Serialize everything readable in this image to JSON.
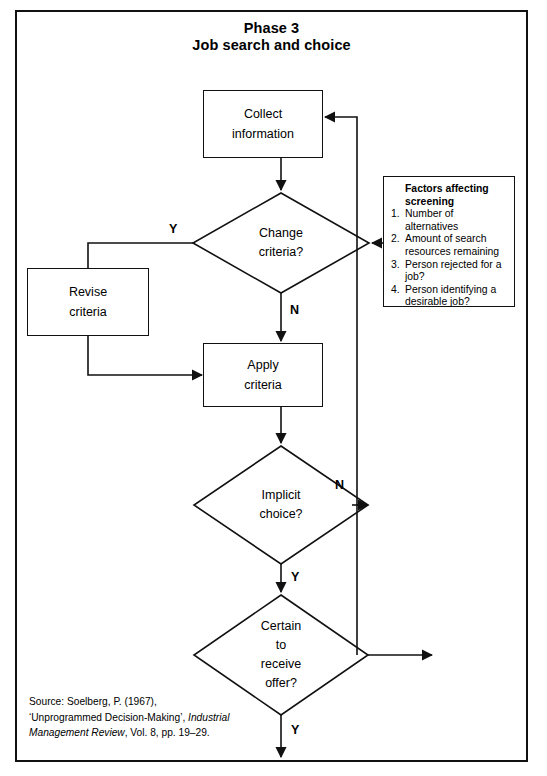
{
  "title": {
    "line1": "Phase 3",
    "line2": "Job search and choice"
  },
  "nodes": {
    "collect": {
      "line1": "Collect",
      "line2": "information"
    },
    "change_criteria": {
      "line1": "Change",
      "line2": "criteria?"
    },
    "revise": {
      "line1": "Revise",
      "line2": "criteria"
    },
    "apply": {
      "line1": "Apply",
      "line2": "criteria"
    },
    "implicit": {
      "line1": "Implicit",
      "line2": "choice?"
    },
    "certain": {
      "line1": "Certain",
      "line2": "to",
      "line3": "receive",
      "line4": "offer?"
    }
  },
  "edge_labels": {
    "change_yes": "Y",
    "change_no": "N",
    "implicit_no": "N",
    "implicit_yes": "Y",
    "certain_yes": "Y"
  },
  "factors": {
    "heading_line1": "Factors affecting",
    "heading_line2": "screening",
    "items": [
      {
        "num": "1.",
        "text": "Number of alternatives"
      },
      {
        "num": "2.",
        "text": "Amount of search resources remaining"
      },
      {
        "num": "3.",
        "text": "Person rejected for a job?"
      },
      {
        "num": "4.",
        "text": "Person identifying a desirable job?"
      }
    ]
  },
  "source": {
    "line1": "Source: Soelberg, P. (1967),",
    "line2_pre": "‘Unprogrammed Decision-Making’, ",
    "line2_italic": "Industrial",
    "line3_italic": "Management Review",
    "line3_post": ", Vol. 8, pp. 19–29."
  },
  "colors": {
    "stroke": "#111111",
    "background": "#ffffff",
    "text": "#000000"
  }
}
